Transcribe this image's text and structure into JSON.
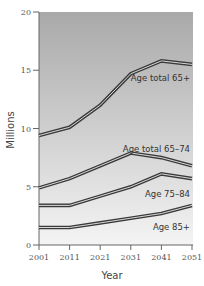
{
  "chart_data": {
    "type": "line",
    "title": "",
    "xlabel": "Year",
    "ylabel": "Millions",
    "x": [
      2001,
      2011,
      2021,
      2031,
      2041,
      2051
    ],
    "xticks": [
      "2001",
      "2011",
      "2021",
      "2031",
      "2041",
      "2051"
    ],
    "yticks": [
      "0",
      "5",
      "10",
      "15",
      "20"
    ],
    "ylim": [
      0,
      20
    ],
    "grid": false,
    "legend_position": "inline labels",
    "series": [
      {
        "name": "Age total 65+",
        "values": [
          9.4,
          10.1,
          12.0,
          14.7,
          15.8,
          15.5
        ]
      },
      {
        "name": "Age total 65–74",
        "values": [
          4.9,
          5.7,
          6.8,
          7.9,
          7.5,
          6.8
        ]
      },
      {
        "name": "Age 75–84",
        "values": [
          3.4,
          3.4,
          4.2,
          5.0,
          6.1,
          5.7
        ]
      },
      {
        "name": "Age 85+",
        "values": [
          1.5,
          1.5,
          1.9,
          2.3,
          2.7,
          3.4
        ]
      }
    ],
    "colors": {
      "background_top": "#a9a9a9",
      "background_bottom": "#f4f4f4",
      "line_outer": "#3a3a3a",
      "line_inner": "#d8d8d8",
      "axis": "#666666"
    }
  },
  "labels": {
    "s0": "Age total 65+",
    "s1": "Age total 65–74",
    "s2": "Age 75–84",
    "s3": "Age 85+",
    "xlabel": "Year",
    "ylabel": "Millions"
  }
}
